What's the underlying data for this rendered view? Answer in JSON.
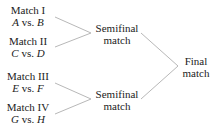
{
  "matches": [
    {
      "title": "Match I",
      "p1": "A",
      "vs": "vs.",
      "p2": "B"
    },
    {
      "title": "Match II",
      "p1": "C",
      "vs": "vs.",
      "p2": "D"
    },
    {
      "title": "Match III",
      "p1": "E",
      "vs": "vs.",
      "p2": "F"
    },
    {
      "title": "Match IV",
      "p1": "G",
      "vs": "vs.",
      "p2": "H"
    }
  ],
  "semifinals": [
    {
      "line1": "Semifinal",
      "line2": "match"
    },
    {
      "line1": "Semifinal",
      "line2": "match"
    }
  ],
  "final": {
    "line1": "Final",
    "line2": "match"
  },
  "colors": {
    "line": "#b8b8b8",
    "text": "#222222"
  }
}
